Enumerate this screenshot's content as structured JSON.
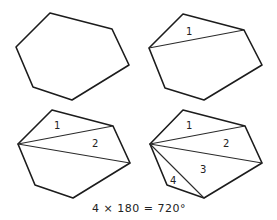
{
  "panels": [
    {
      "id": "hexagon",
      "vertices": [
        [
          50,
          13
        ],
        [
          112,
          29
        ],
        [
          129,
          65
        ],
        [
          72,
          100
        ],
        [
          33,
          87
        ],
        [
          16,
          47
        ]
      ],
      "diagonals": [],
      "labels": []
    },
    {
      "id": "one-diagonal",
      "vertices": [
        [
          183,
          14
        ],
        [
          244,
          30
        ],
        [
          262,
          65
        ],
        [
          204,
          100
        ],
        [
          165,
          88
        ],
        [
          149,
          48
        ]
      ],
      "diagonals": [
        [
          [
            149,
            48
          ],
          [
            244,
            30
          ]
        ]
      ],
      "labels": [
        {
          "text": "1",
          "x": 186,
          "y": 35
        }
      ]
    },
    {
      "id": "two-diagonals",
      "vertices": [
        [
          52,
          110
        ],
        [
          113,
          126
        ],
        [
          130,
          163
        ],
        [
          73,
          198
        ],
        [
          35,
          185
        ],
        [
          18,
          144
        ]
      ],
      "diagonals": [
        [
          [
            18,
            144
          ],
          [
            113,
            126
          ]
        ],
        [
          [
            18,
            144
          ],
          [
            130,
            163
          ]
        ]
      ],
      "labels": [
        {
          "text": "1",
          "x": 54,
          "y": 129
        },
        {
          "text": "2",
          "x": 92,
          "y": 147
        }
      ]
    },
    {
      "id": "three-diagonals",
      "vertices": [
        [
          183,
          110
        ],
        [
          245,
          126
        ],
        [
          262,
          163
        ],
        [
          204,
          198
        ],
        [
          167,
          185
        ],
        [
          150,
          144
        ]
      ],
      "diagonals": [
        [
          [
            150,
            144
          ],
          [
            245,
            126
          ]
        ],
        [
          [
            150,
            144
          ],
          [
            262,
            163
          ]
        ],
        [
          [
            150,
            144
          ],
          [
            204,
            198
          ]
        ]
      ],
      "labels": [
        {
          "text": "1",
          "x": 186,
          "y": 129
        },
        {
          "text": "2",
          "x": 223,
          "y": 147
        },
        {
          "text": "3",
          "x": 200,
          "y": 173
        },
        {
          "text": "4",
          "x": 170,
          "y": 184
        }
      ]
    }
  ],
  "formula": "4 × 180 = 720°"
}
